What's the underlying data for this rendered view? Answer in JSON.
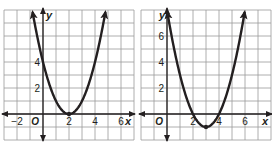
{
  "graphs": [
    {
      "id": "left",
      "x_axis_label": "x",
      "y_axis_label": "y",
      "origin_label": "O",
      "x_ticks": [
        {
          "value": -2,
          "label": "−2"
        },
        {
          "value": 2,
          "label": "2"
        },
        {
          "value": 4,
          "label": "4"
        },
        {
          "value": 6,
          "label": "6"
        }
      ],
      "y_ticks": [
        {
          "value": 2,
          "label": "2"
        },
        {
          "value": 4,
          "label": "4"
        }
      ],
      "xlim": [
        -3,
        7
      ],
      "ylim": [
        -2,
        8
      ],
      "curve": {
        "type": "parabola",
        "vertex": [
          2,
          0
        ],
        "a": 1,
        "equation": "y = (x - 2)^2"
      }
    },
    {
      "id": "right",
      "x_axis_label": "x",
      "y_axis_label": "y",
      "origin_label": "O",
      "x_ticks": [
        {
          "value": 2,
          "label": "2"
        },
        {
          "value": 4,
          "label": "4"
        },
        {
          "value": 6,
          "label": "6"
        }
      ],
      "y_ticks": [
        {
          "value": 2,
          "label": "2"
        },
        {
          "value": 4,
          "label": "4"
        },
        {
          "value": 6,
          "label": "6"
        }
      ],
      "xlim": [
        -2,
        8
      ],
      "ylim": [
        -2,
        8
      ],
      "curve": {
        "type": "parabola",
        "vertex": [
          3,
          -1
        ],
        "a": 1,
        "equation": "y = (x - 3)^2 - 1"
      }
    }
  ],
  "colors": {
    "grid": "#9a9a9a",
    "axis": "#231f20",
    "curve": "#231f20",
    "background": "#ffffff"
  }
}
